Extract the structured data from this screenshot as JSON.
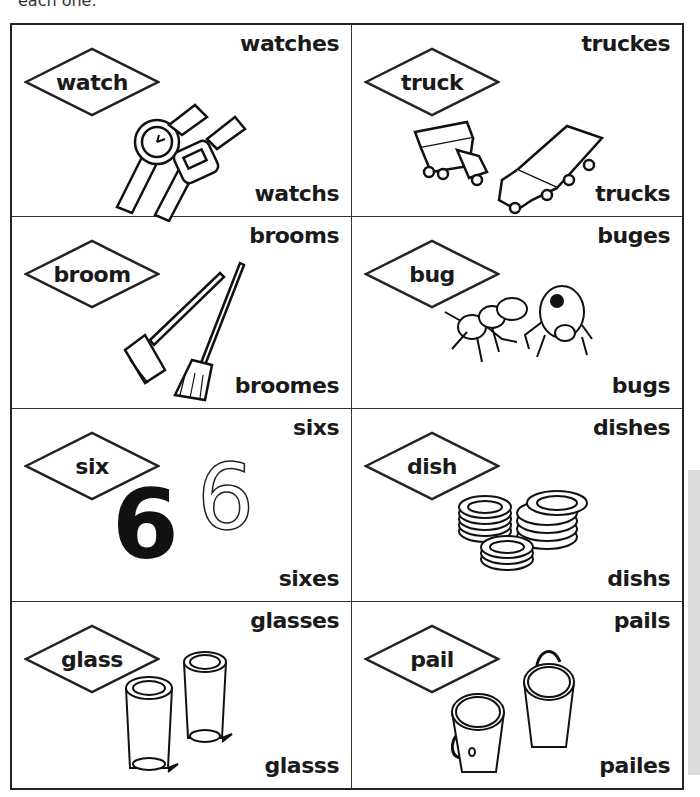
{
  "header": {
    "instruction_fragment": "each one."
  },
  "cards": [
    {
      "word": "watch",
      "option_top": "watches",
      "option_bottom": "watchs",
      "picture": "two-watches"
    },
    {
      "word": "truck",
      "option_top": "truckes",
      "option_bottom": "trucks",
      "picture": "two-trucks"
    },
    {
      "word": "broom",
      "option_top": "brooms",
      "option_bottom": "broomes",
      "picture": "two-brooms"
    },
    {
      "word": "bug",
      "option_top": "buges",
      "option_bottom": "bugs",
      "picture": "two-bugs"
    },
    {
      "word": "six",
      "option_top": "sixs",
      "option_bottom": "sixes",
      "picture": "two-sixes",
      "digit": "6"
    },
    {
      "word": "dish",
      "option_top": "dishes",
      "option_bottom": "dishs",
      "picture": "stacks-of-dishes"
    },
    {
      "word": "glass",
      "option_top": "glasses",
      "option_bottom": "glasss",
      "picture": "two-glasses"
    },
    {
      "word": "pail",
      "option_top": "pails",
      "option_bottom": "pailes",
      "picture": "two-pails"
    }
  ]
}
